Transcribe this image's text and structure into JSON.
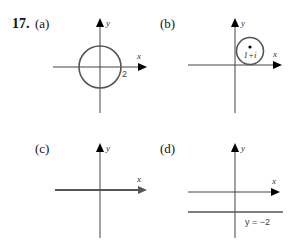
{
  "problem": {
    "number": "17.",
    "panels": [
      {
        "label": "(a)",
        "x_axis_label": "x",
        "y_axis_label": "y",
        "annotation": "2",
        "shape": "circle centered at origin, radius 2"
      },
      {
        "label": "(b)",
        "x_axis_label": "x",
        "y_axis_label": "y",
        "annotation": "1+i",
        "shape": "circle centered at 1+i"
      },
      {
        "label": "(c)",
        "x_axis_label": "x",
        "y_axis_label": "y",
        "shape": "highlighted x-axis (real axis)"
      },
      {
        "label": "(d)",
        "x_axis_label": "x",
        "y_axis_label": "y",
        "annotation": "y = −2",
        "shape": "horizontal line y = -2"
      }
    ]
  },
  "colors": {
    "axis": "#444444",
    "curve": "#555555",
    "arrow": "#000000",
    "text": "#111111"
  }
}
